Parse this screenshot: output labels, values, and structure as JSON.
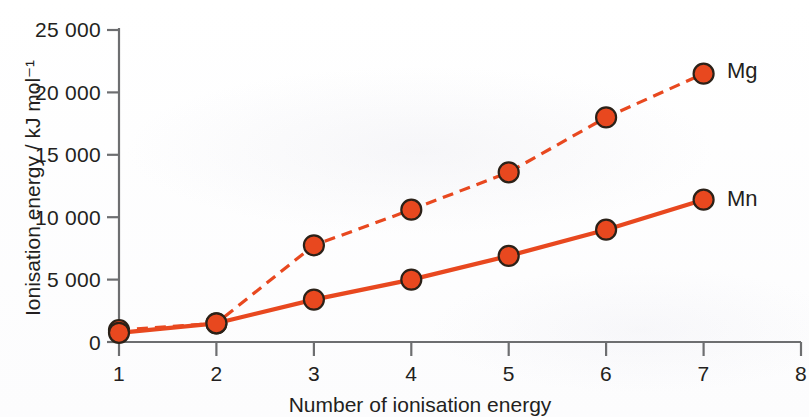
{
  "chart_data": {
    "type": "line",
    "title": "",
    "xlabel": "Number of ionisation energy",
    "ylabel": "Ionisation energy / kJ mol⁻¹",
    "x": [
      1,
      2,
      3,
      4,
      5,
      6,
      7
    ],
    "xlim": [
      1,
      8
    ],
    "ylim": [
      0,
      25000
    ],
    "x_ticks": [
      "1",
      "2",
      "3",
      "4",
      "5",
      "6",
      "7",
      "8"
    ],
    "y_ticks": [
      "0",
      "5000",
      "10000",
      "15000",
      "20000",
      "25000"
    ],
    "y_tick_labels": [
      "0",
      "5 000",
      "10 000",
      "15 000",
      "20 000",
      "25 000"
    ],
    "grid": false,
    "legend_position": "right-of-last-point",
    "series": [
      {
        "name": "Mg",
        "style": "dashed",
        "color": "#e8481f",
        "marker": "circle",
        "values": [
          960,
          1500,
          7750,
          10600,
          13600,
          18000,
          21500
        ]
      },
      {
        "name": "Mn",
        "style": "solid",
        "color": "#e8481f",
        "marker": "circle",
        "values": [
          740,
          1500,
          3400,
          5000,
          6900,
          9000,
          11400
        ]
      }
    ]
  },
  "axes": {
    "y_label": "Ionisation energy / kJ mol⁻¹",
    "x_label": "Number of ionisation energy",
    "y_tick_0": "0",
    "y_tick_1": "5 000",
    "y_tick_2": "10 000",
    "y_tick_3": "15 000",
    "y_tick_4": "20 000",
    "y_tick_5": "25 000",
    "x_tick_1": "1",
    "x_tick_2": "2",
    "x_tick_3": "3",
    "x_tick_4": "4",
    "x_tick_5": "5",
    "x_tick_6": "6",
    "x_tick_7": "7",
    "x_tick_8": "8"
  },
  "legend": {
    "mg_label": "Mg",
    "mn_label": "Mn"
  },
  "colors": {
    "series": "#e8481f",
    "marker_fill": "#e8481f",
    "marker_stroke": "#2b2118",
    "axis": "#6d6e70",
    "text": "#231f20",
    "background": "#ffffff"
  }
}
